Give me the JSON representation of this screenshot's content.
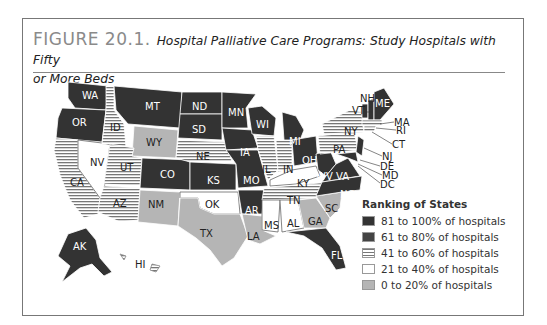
{
  "figure": {
    "number": "FIGURE 20.1.",
    "caption": "Hospital Palliative Care Programs: Study Hospitals with Fifty or More Beds",
    "caption_line1": "Hospital Palliative Care Programs: Study Hospitals with Fifty",
    "caption_line2": "or More Beds"
  },
  "legend": {
    "title": "Ranking of States",
    "items": [
      {
        "label": "81 to 100% of hospitals",
        "color": "#333333",
        "pattern": "solid"
      },
      {
        "label": "61 to 80% of hospitals",
        "color": "#444444",
        "pattern": "solid"
      },
      {
        "label": "41 to 60% of hospitals",
        "color": "#ffffff",
        "pattern": "horizontal-lines"
      },
      {
        "label": "21 to 40% of hospitals",
        "color": "#ffffff",
        "pattern": "solid"
      },
      {
        "label": "0 to 20% of hospitals",
        "color": "#b5b5b5",
        "pattern": "solid"
      }
    ]
  },
  "states": {
    "dark": [
      "WA",
      "OR",
      "MT",
      "ND",
      "SD",
      "MN",
      "WI",
      "IA",
      "MO",
      "KS",
      "CO",
      "AR",
      "MI",
      "OH",
      "WV",
      "VA",
      "NC",
      "FL",
      "AK",
      "ME",
      "NJ",
      "MD",
      "DE",
      "DC",
      "NH",
      "VT"
    ],
    "lined": [
      "ID",
      "CA",
      "UT",
      "AZ",
      "NE",
      "IL",
      "IN",
      "TN",
      "NY",
      "PA",
      "HI",
      "MA",
      "RI",
      "CT"
    ],
    "white": [
      "NV",
      "OK",
      "KY",
      "MS",
      "AL"
    ],
    "gray": [
      "WY",
      "NM",
      "TX",
      "LA",
      "GA",
      "SC"
    ]
  },
  "labels": {
    "WA": "WA",
    "OR": "OR",
    "ID": "ID",
    "MT": "MT",
    "ND": "ND",
    "SD": "SD",
    "MN": "MN",
    "WI": "WI",
    "WY": "WY",
    "NV": "NV",
    "UT": "UT",
    "CA": "CA",
    "CO": "CO",
    "NE": "NE",
    "KS": "KS",
    "IA": "IA",
    "IL": "IL",
    "IN": "IN",
    "MI": "MI",
    "OH": "OH",
    "MO": "MO",
    "AZ": "AZ",
    "NM": "NM",
    "OK": "OK",
    "TX": "TX",
    "AR": "AR",
    "LA": "LA",
    "MS": "MS",
    "AL": "AL",
    "TN": "TN",
    "KY": "KY",
    "WV": "WV",
    "VA": "VA",
    "NC": "NC",
    "SC": "SC",
    "GA": "GA",
    "FL": "FL",
    "PA": "PA",
    "NY": "NY",
    "ME": "ME",
    "NH": "NH",
    "VT": "VT",
    "MA": "MA",
    "RI": "RI",
    "CT": "CT",
    "NJ": "NJ",
    "DE": "DE",
    "MD": "MD",
    "DC": "DC",
    "AK": "AK",
    "HI": "HI"
  }
}
